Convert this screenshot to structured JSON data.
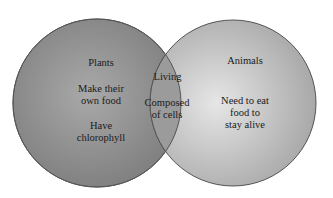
{
  "diagram": {
    "type": "venn",
    "colors": {
      "left_circle": "#8f8f8f",
      "right_circle": "#c9c9c9",
      "overlap": "#9a9a9a",
      "outline": "#555555",
      "text": "#1a1a1a"
    },
    "left": {
      "title": "Plants",
      "items": [
        "Make their own food",
        "Have chlorophyll"
      ],
      "item_lines": [
        [
          "Make their",
          "own food"
        ],
        [
          "Have",
          "chlorophyll"
        ]
      ]
    },
    "overlap": {
      "items": [
        "Living",
        "Composed of cells"
      ],
      "item_lines": [
        [
          "Living"
        ],
        [
          "Composed",
          "of cells"
        ]
      ]
    },
    "right": {
      "title": "Animals",
      "items": [
        "Need to eat food to stay alive"
      ],
      "item_lines": [
        [
          "Need to eat",
          "food to",
          "stay alive"
        ]
      ]
    }
  }
}
